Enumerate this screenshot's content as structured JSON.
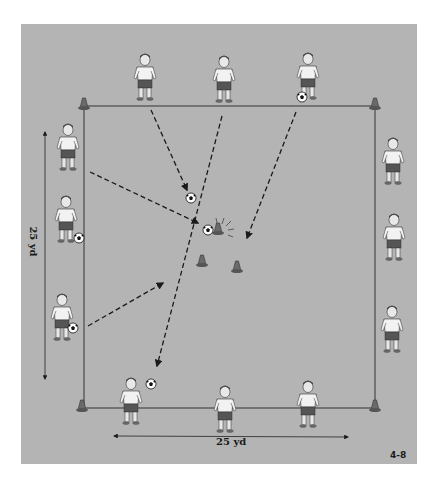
{
  "figure": {
    "number": "4-8",
    "background_color": "#b4b4b4",
    "line_color": "#333333"
  },
  "dimensions": {
    "width_label": "25 yd",
    "height_label": "25 yd"
  },
  "field": {
    "corner_cones": 4,
    "center_cones": 2,
    "target_cone_hit": true
  },
  "players": {
    "top": [
      {
        "id": "top-1",
        "has_ball": false
      },
      {
        "id": "top-2",
        "has_ball": false
      },
      {
        "id": "top-3",
        "has_ball": true
      }
    ],
    "left": [
      {
        "id": "left-1",
        "has_ball": false
      },
      {
        "id": "left-2",
        "has_ball": true
      },
      {
        "id": "left-3",
        "has_ball": true
      }
    ],
    "right": [
      {
        "id": "right-1",
        "has_ball": false
      },
      {
        "id": "right-2",
        "has_ball": false
      },
      {
        "id": "right-3",
        "has_ball": false
      }
    ],
    "bottom": [
      {
        "id": "bottom-1",
        "has_ball": true
      },
      {
        "id": "bottom-2",
        "has_ball": false
      },
      {
        "id": "bottom-3",
        "has_ball": false
      }
    ]
  },
  "passes": [
    {
      "from": "top-1",
      "to": "center"
    },
    {
      "from": "top-2",
      "to": "bottom-1"
    },
    {
      "from": "top-3",
      "to": "center"
    },
    {
      "from": "left-1",
      "to": "center-cone"
    },
    {
      "from": "left-3",
      "to": "center"
    }
  ]
}
